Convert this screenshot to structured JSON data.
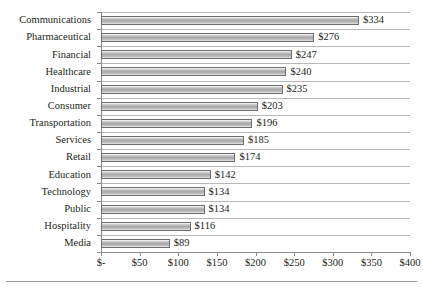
{
  "chart_data": {
    "type": "bar",
    "orientation": "horizontal",
    "title": "",
    "xlabel": "",
    "ylabel": "",
    "xlim": [
      0,
      400
    ],
    "xticks": [
      0,
      50,
      100,
      150,
      200,
      250,
      300,
      350,
      400
    ],
    "xtick_labels": [
      "$-",
      "$50",
      "$100",
      "$150",
      "$200",
      "$250",
      "$300",
      "$350",
      "$400"
    ],
    "grid": true,
    "legend": false,
    "categories": [
      "Communications",
      "Pharmaceutical",
      "Financial",
      "Healthcare",
      "Industrial",
      "Consumer",
      "Transportation",
      "Services",
      "Retail",
      "Education",
      "Technology",
      "Public",
      "Hospitality",
      "Media"
    ],
    "values": [
      334,
      276,
      247,
      240,
      235,
      203,
      196,
      185,
      174,
      142,
      134,
      134,
      116,
      89
    ],
    "data_labels": [
      "$334",
      "$276",
      "$247",
      "$240",
      "$235",
      "$203",
      "$196",
      "$185",
      "$174",
      "$142",
      "$134",
      "$134",
      "$116",
      "$89"
    ],
    "colors": {
      "bar_fill_light": "#d2d2d2",
      "bar_fill_mid": "#a8a8a8",
      "bar_border": "#6e6e6e",
      "gridline": "#b8b8b8",
      "axis": "#8c8c8c",
      "text": "#231f20",
      "background": "#ffffff"
    }
  }
}
